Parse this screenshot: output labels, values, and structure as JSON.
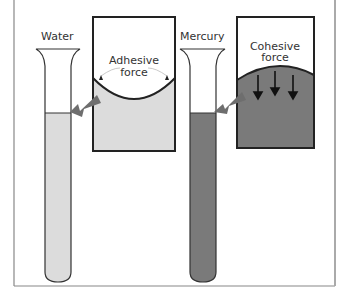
{
  "diagram": {
    "tubes": [
      {
        "label": "Water",
        "liquid_color": "#dcdcdc"
      },
      {
        "label": "Mercury",
        "liquid_color": "#7a7a7a"
      }
    ],
    "insets": [
      {
        "label_line1": "Adhesive",
        "label_line2": "force",
        "fill": "#dcdcdc",
        "meniscus": "concave"
      },
      {
        "label_line1": "Cohesive",
        "label_line2": "force",
        "fill": "#7a7a7a",
        "meniscus": "convex"
      }
    ],
    "colors": {
      "frame": "#888888",
      "outline": "#222222",
      "arrow": "#6e6e6e"
    }
  }
}
